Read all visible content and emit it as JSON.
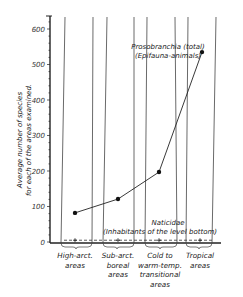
{
  "chart_data": {
    "type": "line",
    "title": "",
    "xlabel": "",
    "ylabel": "Average number of species for each of the areas examined.",
    "ylabel_lines": [
      "Average number of species",
      "for each of the areas examined."
    ],
    "ylim": [
      0,
      640
    ],
    "yticks": [
      0,
      100,
      200,
      300,
      400,
      500,
      600
    ],
    "grid": false,
    "categories": [
      "High-arct. areas",
      "Sub-arct. boreal areas",
      "Cold to warm-temp. transitional areas",
      "Tropical areas"
    ],
    "category_lines": [
      [
        "High-arct.",
        "areas"
      ],
      [
        "Sub-arct.",
        "boreal",
        "areas"
      ],
      [
        "Cold to",
        "warm-temp.",
        "transitional",
        "areas"
      ],
      [
        "Tropical",
        "areas"
      ]
    ],
    "series": [
      {
        "name": "Prosobranchia (total) (Epifauna-animals)",
        "label_lines": [
          "Prosobranchia  (total)",
          "(Epifauna-animals)"
        ],
        "marker": "filled-circle",
        "line": "solid",
        "values": [
          82,
          121,
          197,
          535
        ]
      },
      {
        "name": "Naticidae (Inhabitants of the level bottom)",
        "label_lines": [
          "Naticidae",
          "(Inhabitants of the level bottom)"
        ],
        "marker": "plus",
        "line": "dashed",
        "values": [
          5,
          5,
          5,
          5
        ]
      }
    ]
  }
}
